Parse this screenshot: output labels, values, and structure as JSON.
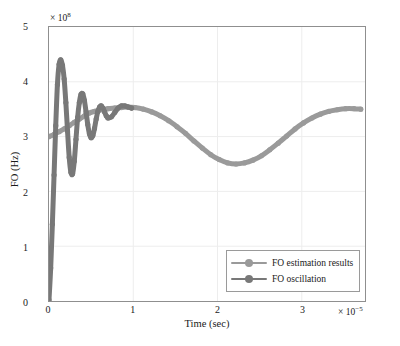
{
  "chart_data": {
    "type": "line",
    "title": "",
    "xlabel": "Time (sec)",
    "ylabel": "FO (Hz)",
    "x_multiplier": "× 10",
    "x_exponent": "−5",
    "y_multiplier": "× 10",
    "y_exponent": "8",
    "xlim": [
      0,
      3.75
    ],
    "ylim": [
      0,
      5
    ],
    "xticks": [
      "0",
      "1",
      "2",
      "3"
    ],
    "xtick_values": [
      0,
      1,
      2,
      3
    ],
    "yticks": [
      "0",
      "1",
      "2",
      "3",
      "4",
      "5"
    ],
    "ytick_values": [
      0,
      1,
      2,
      3,
      4,
      5
    ],
    "grid": true,
    "legend_position": "bottom-right",
    "colors": {
      "estimation": "#9a9a9a",
      "oscillation": "#787878",
      "axis": "#8f8f8f",
      "grid": "#ededed",
      "text": "#1a1a1a"
    },
    "series": [
      {
        "name": "FO estimation results",
        "color": "#9a9a9a",
        "marker": "circle",
        "x": [
          0.0,
          0.06,
          0.12,
          0.18,
          0.24,
          0.3,
          0.36,
          0.42,
          0.48,
          0.54,
          0.62,
          0.7,
          0.78,
          0.86,
          0.94,
          1.02,
          1.12,
          1.22,
          1.32,
          1.42,
          1.52,
          1.62,
          1.72,
          1.82,
          1.92,
          2.02,
          2.12,
          2.22,
          2.32,
          2.42,
          2.52,
          2.62,
          2.72,
          2.82,
          2.92,
          3.02,
          3.12,
          3.22,
          3.32,
          3.42,
          3.52,
          3.62,
          3.7
        ],
        "y": [
          3.0,
          3.04,
          3.09,
          3.14,
          3.2,
          3.26,
          3.32,
          3.38,
          3.43,
          3.46,
          3.49,
          3.51,
          3.52,
          3.53,
          3.54,
          3.53,
          3.5,
          3.45,
          3.38,
          3.29,
          3.18,
          3.06,
          2.92,
          2.79,
          2.67,
          2.58,
          2.52,
          2.5,
          2.52,
          2.57,
          2.65,
          2.76,
          2.88,
          3.01,
          3.14,
          3.25,
          3.34,
          3.41,
          3.46,
          3.49,
          3.51,
          3.51,
          3.5
        ]
      },
      {
        "name": "FO oscillation",
        "color": "#787878",
        "marker": "circle",
        "x": [
          0.0,
          0.02,
          0.04,
          0.06,
          0.08,
          0.1,
          0.12,
          0.14,
          0.16,
          0.18,
          0.2,
          0.22,
          0.24,
          0.26,
          0.28,
          0.3,
          0.32,
          0.34,
          0.36,
          0.38,
          0.4,
          0.42,
          0.44,
          0.46,
          0.48,
          0.5,
          0.52,
          0.54,
          0.56,
          0.58,
          0.6,
          0.62,
          0.64,
          0.66,
          0.68,
          0.7,
          0.74,
          0.78,
          0.82,
          0.86,
          0.9,
          0.94,
          0.98
        ],
        "y": [
          0.02,
          0.6,
          1.4,
          2.3,
          3.2,
          3.95,
          4.32,
          4.4,
          4.3,
          4.05,
          3.62,
          3.1,
          2.62,
          2.35,
          2.32,
          2.55,
          2.95,
          3.35,
          3.62,
          3.77,
          3.78,
          3.66,
          3.45,
          3.22,
          3.05,
          2.98,
          3.02,
          3.15,
          3.32,
          3.46,
          3.54,
          3.56,
          3.52,
          3.45,
          3.38,
          3.34,
          3.36,
          3.44,
          3.52,
          3.56,
          3.56,
          3.54,
          3.52
        ]
      }
    ]
  },
  "legend": {
    "items": [
      {
        "label": "FO estimation results"
      },
      {
        "label": "FO oscillation"
      }
    ]
  }
}
